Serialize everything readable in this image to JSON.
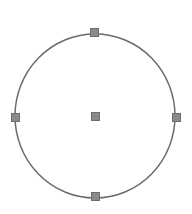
{
  "canvas": {
    "width": 192,
    "height": 214,
    "background_color": "#ffffff",
    "label": "Drawing canvas"
  },
  "shape": {
    "type": "circle",
    "name": "Circle",
    "center_x": 95,
    "center_y": 116,
    "radius_x": 80,
    "radius_y": 82,
    "stroke_color": "#6b6b6b",
    "stroke_width": 1.5,
    "fill_color": "none",
    "selected": true
  },
  "selection": {
    "handle_fill_color": "#8a8a8a",
    "handle_border_color": "#6e6e6e",
    "handle_size": 9,
    "handles": [
      {
        "id": "top",
        "label": "Top resize handle",
        "x": 94,
        "y": 32
      },
      {
        "id": "right",
        "label": "Right resize handle",
        "x": 176,
        "y": 117
      },
      {
        "id": "bottom",
        "label": "Bottom resize handle",
        "x": 95,
        "y": 196
      },
      {
        "id": "left",
        "label": "Left resize handle",
        "x": 15,
        "y": 117
      },
      {
        "id": "center",
        "label": "Center move handle",
        "x": 95,
        "y": 116
      }
    ]
  },
  "chart_data": {
    "type": "scatter",
    "title": "",
    "xlabel": "",
    "ylabel": "",
    "xlim": [
      0,
      192
    ],
    "ylim": [
      0,
      214
    ],
    "grid": false,
    "legend": null,
    "series": [
      {
        "name": "Circle outline",
        "shape": "circle",
        "center": [
          95,
          116
        ],
        "radius": 80
      },
      {
        "name": "Selection handles",
        "x": [
          94,
          176,
          95,
          15,
          95
        ],
        "y": [
          32,
          117,
          196,
          117,
          116
        ],
        "labels": [
          "top",
          "right",
          "bottom",
          "left",
          "center"
        ]
      }
    ]
  }
}
